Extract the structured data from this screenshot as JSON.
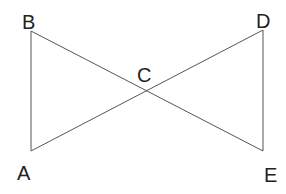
{
  "diagram": {
    "title": "",
    "type": "geometry",
    "stroke_color": "#555555",
    "label_color": "#222222",
    "points": {
      "A": {
        "label": "A",
        "x": 31,
        "y": 151
      },
      "B": {
        "label": "B",
        "x": 31,
        "y": 31
      },
      "C": {
        "label": "C",
        "x": 147,
        "y": 91
      },
      "D": {
        "label": "D",
        "x": 263,
        "y": 30
      },
      "E": {
        "label": "E",
        "x": 263,
        "y": 151
      }
    },
    "segments": [
      {
        "name": "AB",
        "from": "A",
        "to": "B"
      },
      {
        "name": "BE",
        "from": "B",
        "to": "E"
      },
      {
        "name": "AD",
        "from": "A",
        "to": "D"
      },
      {
        "name": "DE",
        "from": "D",
        "to": "E"
      }
    ],
    "labels": {
      "A": "A",
      "B": "B",
      "C": "C",
      "D": "D",
      "E": "E"
    }
  }
}
